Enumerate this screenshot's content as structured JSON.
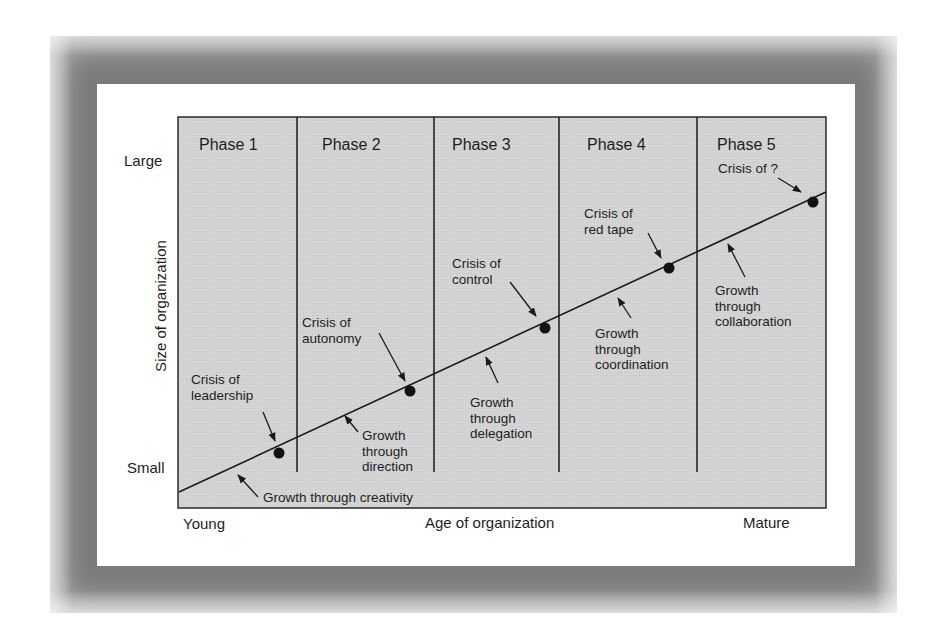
{
  "diagram": {
    "y_axis": {
      "label": "Size of organization",
      "top": "Large",
      "bottom": "Small"
    },
    "x_axis": {
      "label": "Age of organization",
      "left": "Young",
      "right": "Mature"
    },
    "phases": [
      {
        "label": "Phase 1"
      },
      {
        "label": "Phase 2"
      },
      {
        "label": "Phase 3"
      },
      {
        "label": "Phase 4"
      },
      {
        "label": "Phase 5"
      }
    ],
    "crises": [
      {
        "label": "Crisis of\nleadership"
      },
      {
        "label": "Crisis of\nautonomy"
      },
      {
        "label": "Crisis of\ncontrol"
      },
      {
        "label": "Crisis of\nred tape"
      },
      {
        "label": "Crisis of ?"
      }
    ],
    "growth": [
      {
        "label": "Growth through creativity"
      },
      {
        "label": "Growth\nthrough\ndirection"
      },
      {
        "label": "Growth\nthrough\ndelegation"
      },
      {
        "label": "Growth\nthrough\ncoordination"
      },
      {
        "label": "Growth\nthrough\ncollaboration"
      }
    ],
    "colors": {
      "panel_fill": "#d6d6d6",
      "line": "#1a1a1a",
      "frame": "#8a8a8a"
    }
  }
}
